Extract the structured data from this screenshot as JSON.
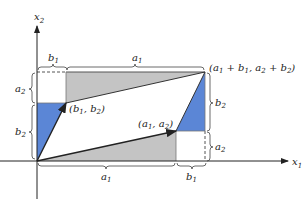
{
  "figure": {
    "axes": {
      "x_label": "x",
      "x_sub": "1",
      "y_label": "x",
      "y_sub": "2"
    },
    "points": {
      "b": {
        "text_open": "(b",
        "s1": "1",
        "mid": ", b",
        "s2": "2",
        "close": ")"
      },
      "a": {
        "text_open": "(a",
        "s1": "1",
        "mid": ", a",
        "s2": "2",
        "close": ")"
      },
      "sum": {
        "p1": "(a",
        "s1": "1",
        "p2": " + b",
        "s2": "1",
        "p3": ", a",
        "s3": "2",
        "p4": " + b",
        "s4": "2",
        "p5": ")"
      }
    },
    "braces": {
      "top_b1": {
        "v": "b",
        "s": "1"
      },
      "top_a1": {
        "v": "a",
        "s": "1"
      },
      "left_a2": {
        "v": "a",
        "s": "2"
      },
      "left_b2": {
        "v": "b",
        "s": "2"
      },
      "right_b2": {
        "v": "b",
        "s": "2"
      },
      "right_a2": {
        "v": "a",
        "s": "2"
      },
      "bottom_a1": {
        "v": "a",
        "s": "1"
      },
      "bottom_b1": {
        "v": "b",
        "s": "1"
      }
    },
    "colors": {
      "gray": "#c4c4c4",
      "blue": "#5b86d6",
      "line": "#222222",
      "accent_top": "#6f7fd8"
    }
  }
}
